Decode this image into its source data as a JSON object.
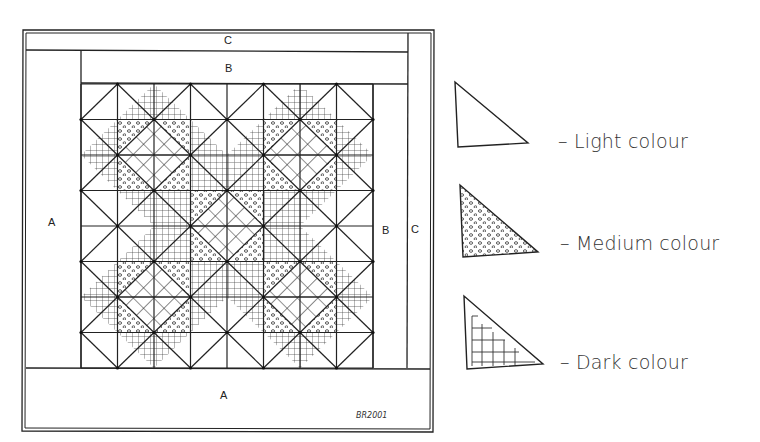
{
  "diagram": {
    "quilt": {
      "border_labels": {
        "top_outer": "C",
        "top_inner": "B",
        "left": "A",
        "right_inner": "B",
        "right_outer": "C",
        "bottom": "A"
      },
      "signature": "BR2001",
      "grid": {
        "columns": 8,
        "rows": 8
      },
      "star_centers": [
        [
          2,
          2
        ],
        [
          6,
          2
        ],
        [
          4,
          4
        ],
        [
          2,
          6
        ],
        [
          6,
          6
        ]
      ]
    },
    "legend": [
      {
        "fill": "plain",
        "label": "– Light colour"
      },
      {
        "fill": "dots",
        "label": "– Medium colour"
      },
      {
        "fill": "grid",
        "label": "– Dark colour"
      }
    ],
    "colors": {
      "ink": "#222222",
      "paper": "#ffffff",
      "text": "#333333"
    }
  }
}
